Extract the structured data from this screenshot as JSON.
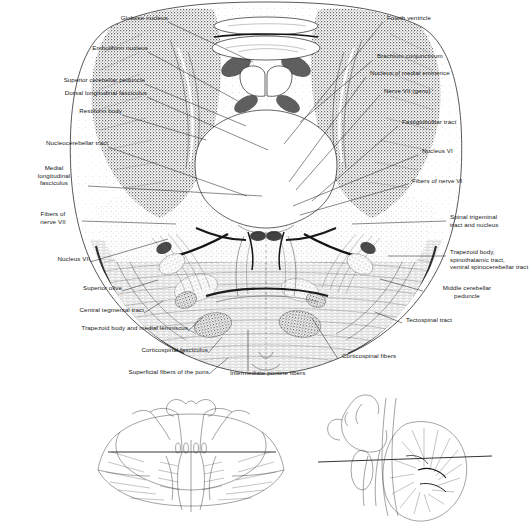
{
  "figure": {
    "type": "anatomical-illustration",
    "main_view": "transverse-section-pons-and-cerebellum",
    "inset_count": 2
  },
  "labels_left": [
    {
      "id": "globose-nucleus",
      "text": "Globose nucleus",
      "x": 108,
      "y": 17,
      "anchor_x": 168,
      "anchor_y": 22,
      "tip_x": 253,
      "tip_y": 62
    },
    {
      "id": "emboliform-nucleus",
      "text": "Emboliform nucleus",
      "x": 84,
      "y": 47,
      "anchor_x": 148,
      "anchor_y": 52,
      "tip_x": 238,
      "tip_y": 101
    },
    {
      "id": "superior-cerebellar-peduncle",
      "text": "Superior cerebellar peduncle",
      "x": 33,
      "y": 79,
      "anchor_x": 145,
      "anchor_y": 84,
      "tip_x": 246,
      "tip_y": 126
    },
    {
      "id": "dorsal-longitudinal-fasciculus",
      "text": "Dorsal longitudinal fasciculus",
      "x": 30,
      "y": 92,
      "anchor_x": 147,
      "anchor_y": 97,
      "tip_x": 268,
      "tip_y": 150
    },
    {
      "id": "restiform-body",
      "text": "Restiform body",
      "x": 58,
      "y": 110,
      "anchor_x": 122,
      "anchor_y": 115,
      "tip_x": 206,
      "tip_y": 140
    },
    {
      "id": "nucleocerebellar-tract",
      "text": "Nucleocerebellar tract",
      "x": 16,
      "y": 142,
      "anchor_x": 108,
      "anchor_y": 147,
      "tip_x": 247,
      "tip_y": 196
    },
    {
      "id": "medial-longitudinal-fasciculus",
      "text": "Medial\nlongitudinal\nfasciculus",
      "x": 18,
      "y": 164,
      "anchor_x": 88,
      "anchor_y": 186,
      "tip_x": 262,
      "tip_y": 196
    },
    {
      "id": "fibers-of-nerve-vii",
      "text": "Fibers of\nnerve VII",
      "x": 27,
      "y": 209,
      "anchor_x": 82,
      "anchor_y": 221,
      "tip_x": 176,
      "tip_y": 224
    },
    {
      "id": "nucleus-vii",
      "text": "Nucleus VII",
      "x": 43,
      "y": 258,
      "anchor_x": 90,
      "anchor_y": 262,
      "tip_x": 168,
      "tip_y": 239
    },
    {
      "id": "superior-olive",
      "text": "Superior olive",
      "x": 69,
      "y": 287,
      "anchor_x": 122,
      "anchor_y": 291,
      "tip_x": 158,
      "tip_y": 280
    },
    {
      "id": "central-tegmental-tract",
      "text": "Central tegmental tract",
      "x": 50,
      "y": 309,
      "anchor_x": 144,
      "anchor_y": 313,
      "tip_x": 163,
      "tip_y": 301
    },
    {
      "id": "trapezoid-body-and-medial-lemniscus",
      "text": "Trapezoid body and medial lemniscus",
      "x": 44,
      "y": 327,
      "anchor_x": 188,
      "anchor_y": 331,
      "tip_x": 202,
      "tip_y": 318
    },
    {
      "id": "corticospinal-fasciculus",
      "text": "Corticospinal fasciculus",
      "x": 114,
      "y": 349,
      "anchor_x": 208,
      "anchor_y": 353,
      "tip_x": 222,
      "tip_y": 337
    },
    {
      "id": "superficial-fibers-of-the-pons",
      "text": "Superficial fibers of the pons",
      "x": 95,
      "y": 371,
      "anchor_x": 209,
      "anchor_y": 374,
      "tip_x": 228,
      "tip_y": 358
    }
  ],
  "labels_right": [
    {
      "id": "fourth-ventricle",
      "text": "Fourth ventricle",
      "x": 385,
      "y": 17,
      "anchor_x": 383,
      "anchor_y": 22,
      "tip_x": 284,
      "tip_y": 144
    },
    {
      "id": "brachium-conjunctivum",
      "text": "Brachium conjunctivum",
      "x": 375,
      "y": 55,
      "anchor_x": 373,
      "anchor_y": 60,
      "tip_x": 300,
      "tip_y": 122
    },
    {
      "id": "nucleus-of-medial-eminence",
      "text": "Nucleus of medial eminence",
      "x": 368,
      "y": 72,
      "anchor_x": 366,
      "anchor_y": 77,
      "tip_x": 289,
      "tip_y": 182
    },
    {
      "id": "nerve-vii-genu",
      "text": "Nerve VII (genu)",
      "x": 382,
      "y": 90,
      "anchor_x": 380,
      "anchor_y": 95,
      "tip_x": 296,
      "tip_y": 190
    },
    {
      "id": "fastigiobulbar-tract",
      "text": "Fastigiobulbar tract",
      "x": 400,
      "y": 121,
      "anchor_x": 398,
      "anchor_y": 126,
      "tip_x": 312,
      "tip_y": 201
    },
    {
      "id": "nucleus-vi",
      "text": "Nucleus VI",
      "x": 420,
      "y": 150,
      "anchor_x": 418,
      "anchor_y": 155,
      "tip_x": 293,
      "tip_y": 206
    },
    {
      "id": "fibers-of-nerve-vi",
      "text": "Fibers of nerve VI",
      "x": 410,
      "y": 180,
      "anchor_x": 408,
      "anchor_y": 184,
      "tip_x": 300,
      "tip_y": 215
    },
    {
      "id": "spinal-trigeminal-tract-and-nucleus",
      "text": "Spinal trigeminal\ntract and nucleus",
      "x": 448,
      "y": 216,
      "anchor_x": 446,
      "anchor_y": 221,
      "tip_x": 352,
      "tip_y": 224
    },
    {
      "id": "trapezoid-body-spinothalamic-ventral-spinocerebellar",
      "text": "Trapezoid body,\nspinothalamic tract,\nventral spinocerebellar tract",
      "x": 448,
      "y": 251,
      "anchor_x": 446,
      "anchor_y": 256,
      "tip_x": 388,
      "tip_y": 256
    },
    {
      "id": "middle-cerebellar-peduncle",
      "text": "Middle cerebellar\npeduncle",
      "x": 425,
      "y": 287,
      "anchor_x": 423,
      "anchor_y": 291,
      "tip_x": 380,
      "tip_y": 279
    },
    {
      "id": "tectospinal-tract",
      "text": "Tectospinal tract",
      "x": 404,
      "y": 319,
      "anchor_x": 402,
      "anchor_y": 323,
      "tip_x": 375,
      "tip_y": 312
    },
    {
      "id": "corticospinal-fibers",
      "text": "Corticospinal fibers",
      "x": 340,
      "y": 355,
      "anchor_x": 338,
      "anchor_y": 359,
      "tip_x": 312,
      "tip_y": 318
    }
  ],
  "labels_bottom": [
    {
      "id": "intermediate-pontine-fibers",
      "text": "Intermediate pontine fibers",
      "x": 228,
      "y": 372,
      "anchor_x": 248,
      "anchor_y": 371,
      "tip_x": 248,
      "tip_y": 330
    }
  ],
  "insets": {
    "left": {
      "id": "dorsal-brainstem-inset",
      "caption": "",
      "section_line": true
    },
    "right": {
      "id": "midsagittal-brainstem-inset",
      "caption": "",
      "section_line": true
    }
  },
  "artist_signature": "Wright",
  "colors": {
    "paper": "#ffffff",
    "ink": "#1a1a1a",
    "leader": "#2a2a2a",
    "gray_tissue": "#8d8d8d",
    "dark_tissue": "#2e2e2e"
  }
}
